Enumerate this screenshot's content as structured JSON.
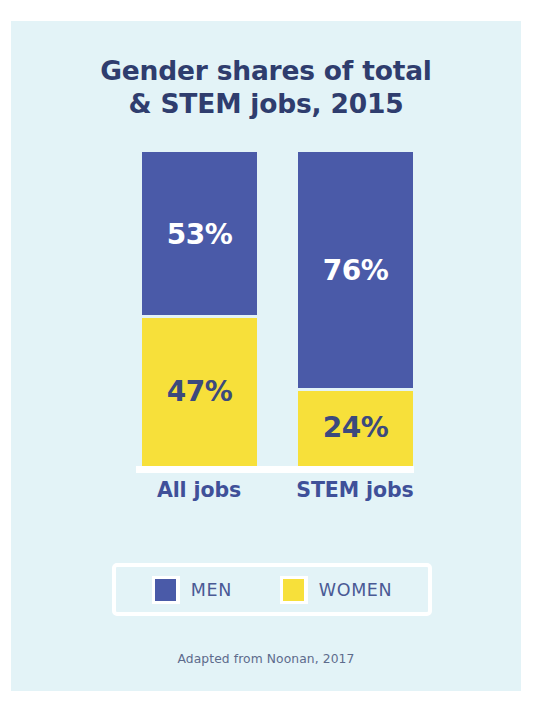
{
  "title": {
    "line1": "Gender shares of total",
    "line2": "& STEM jobs, 2015"
  },
  "source_note": "Adapted from Noonan, 2017",
  "legend": {
    "items": [
      {
        "label": "MEN",
        "color": "#4a5aa8",
        "swatch_icon": "legend-swatch-men"
      },
      {
        "label": "WOMEN",
        "color": "#f7e03a",
        "swatch_icon": "legend-swatch-women"
      }
    ]
  },
  "palette": {
    "background": "#e3f3f7",
    "page": "#ffffff",
    "men": "#4a5aa8",
    "women": "#f7e03a",
    "title_text": "#2f3d6e",
    "category_text": "#3f5099",
    "legend_text": "#4a5a95",
    "source_text": "#5d6b8c",
    "men_label_text": "#ffffff",
    "women_label_text": "#3c4a7d"
  },
  "chart_data": {
    "type": "bar",
    "subtype": "100% stacked vertical",
    "title": "Gender shares of total & STEM jobs, 2015",
    "xlabel": "",
    "ylabel": "",
    "ylim": [
      0,
      100
    ],
    "grid": false,
    "legend_position": "bottom",
    "categories": [
      "All jobs",
      "STEM jobs"
    ],
    "series": [
      {
        "name": "MEN",
        "color": "#4a5aa8",
        "values": [
          53,
          76
        ],
        "value_labels": [
          "53%",
          "76%"
        ]
      },
      {
        "name": "WOMEN",
        "color": "#f7e03a",
        "values": [
          47,
          24
        ],
        "value_labels": [
          "47%",
          "24%"
        ]
      }
    ],
    "columns": [
      {
        "category": "All jobs",
        "segments": [
          {
            "series": "MEN",
            "value": 53,
            "label": "53%"
          },
          {
            "series": "WOMEN",
            "value": 47,
            "label": "47%"
          }
        ]
      },
      {
        "category": "STEM jobs",
        "segments": [
          {
            "series": "MEN",
            "value": 76,
            "label": "76%"
          },
          {
            "series": "WOMEN",
            "value": 24,
            "label": "24%"
          }
        ]
      }
    ],
    "annotations": [
      "Adapted from Noonan, 2017"
    ]
  }
}
